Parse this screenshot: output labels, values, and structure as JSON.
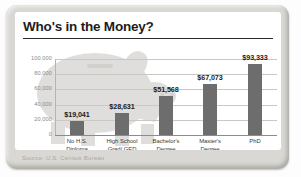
{
  "card": {
    "title": "Who's in the Money?",
    "source": "Source: U.S. Census Bureau",
    "watermark": "piggy-bank-watermark"
  },
  "chart_data": {
    "type": "bar",
    "title": "Who's in the Money?",
    "xlabel": "",
    "ylabel": "",
    "ylim": [
      0,
      100000
    ],
    "grid": true,
    "legend": "none",
    "categories": [
      "No H.S. Diploma",
      "High School Grad/ GED",
      "Bachelor's Degree",
      "Master's Degree",
      "PhD"
    ],
    "category_lines": [
      [
        "No H.S.",
        "Diploma"
      ],
      [
        "High School",
        "Grad/ GED"
      ],
      [
        "Bachelor's",
        "Degree"
      ],
      [
        "Master's",
        "Degree"
      ],
      [
        "PhD",
        ""
      ]
    ],
    "values": [
      19041,
      28631,
      51568,
      67073,
      93333
    ],
    "value_labels": [
      "$19,041",
      "$28,631",
      "$51,568",
      "$67,073",
      "$93,333"
    ],
    "ytick_values": [
      100000,
      80000,
      60000,
      40000,
      20000,
      0
    ],
    "ytick_labels": [
      "100,000",
      "80,000",
      "60,000",
      "40,000",
      "20,000",
      "0"
    ],
    "bar_color": "#6d6d6d",
    "source": "Source: U.S. Census Bureau"
  }
}
